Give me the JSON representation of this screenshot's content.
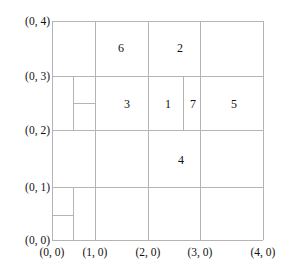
{
  "figure": {
    "type": "grid-partition-diagram",
    "background_color": "#ffffff",
    "line_color": "#b4b4b4",
    "text_color": "#111111"
  },
  "axes": {
    "x_labels": [
      {
        "text": "(0, 0)",
        "value": 0,
        "px": 52
      },
      {
        "text": "(1, 0)",
        "value": 1,
        "px": 95
      },
      {
        "text": "(2, 0)",
        "value": 2,
        "px": 148
      },
      {
        "text": "(3, 0)",
        "value": 3,
        "px": 200
      },
      {
        "text": "(4, 0)",
        "value": 4,
        "px": 263
      }
    ],
    "y_labels": [
      {
        "text": "(0, 4)",
        "value": 4,
        "px": 21
      },
      {
        "text": "(0, 3)",
        "value": 3,
        "px": 76
      },
      {
        "text": "(0, 2)",
        "value": 2,
        "px": 130
      },
      {
        "text": "(0, 1)",
        "value": 1,
        "px": 187
      },
      {
        "text": "(0, 0)",
        "value": 0,
        "px": 240
      }
    ]
  },
  "bounds": {
    "left": 52,
    "right": 263,
    "top": 21,
    "bottom": 240
  },
  "grid_lines": {
    "horizontal": [
      {
        "name": "border-top",
        "y": 21,
        "x1": 52,
        "x2": 263
      },
      {
        "name": "row-y3",
        "y": 76,
        "x1": 52,
        "x2": 263
      },
      {
        "name": "row-y2",
        "y": 130,
        "x1": 52,
        "x2": 263
      },
      {
        "name": "row-y1",
        "y": 187,
        "x1": 52,
        "x2": 263
      },
      {
        "name": "border-bottom",
        "y": 240,
        "x1": 52,
        "x2": 263
      },
      {
        "name": "split-upper-left-small",
        "y": 103,
        "x1": 73,
        "x2": 95
      },
      {
        "name": "split-lower-left-small",
        "y": 215,
        "x1": 52,
        "x2": 73
      }
    ],
    "vertical": [
      {
        "name": "border-left",
        "x": 52,
        "y1": 21,
        "y2": 240
      },
      {
        "name": "col-x1",
        "x": 95,
        "y1": 21,
        "y2": 240
      },
      {
        "name": "col-x2",
        "x": 148,
        "y1": 21,
        "y2": 240
      },
      {
        "name": "col-x3",
        "x": 200,
        "y1": 21,
        "y2": 240
      },
      {
        "name": "border-right",
        "x": 263,
        "y1": 21,
        "y2": 240
      },
      {
        "name": "split-band-y2y3",
        "x": 73,
        "y1": 76,
        "y2": 130
      },
      {
        "name": "split-cell-1-7",
        "x": 183,
        "y1": 76,
        "y2": 130
      },
      {
        "name": "split-band-y0y1",
        "x": 73,
        "y1": 187,
        "y2": 240
      }
    ]
  },
  "cells": [
    {
      "label": "6",
      "x": 121,
      "y": 48
    },
    {
      "label": "2",
      "x": 180,
      "y": 48
    },
    {
      "label": "3",
      "x": 127,
      "y": 104
    },
    {
      "label": "1",
      "x": 168,
      "y": 104
    },
    {
      "label": "7",
      "x": 193,
      "y": 104
    },
    {
      "label": "5",
      "x": 234,
      "y": 104
    },
    {
      "label": "4",
      "x": 181,
      "y": 160
    }
  ]
}
